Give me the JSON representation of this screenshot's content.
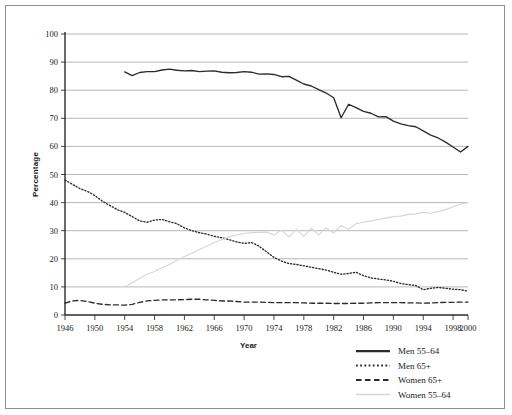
{
  "chart_data": {
    "type": "line",
    "title": "",
    "xlabel": "Year",
    "ylabel": "Percentage",
    "xlim": [
      1946,
      2000
    ],
    "ylim": [
      0,
      100
    ],
    "ytick_step": 10,
    "grid": "horizontal",
    "legend_position": "bottom-right",
    "yticks": [
      "0",
      "10",
      "20",
      "30",
      "40",
      "50",
      "60",
      "70",
      "80",
      "90",
      "100"
    ],
    "xticks": [
      "1946",
      "1950",
      "1954",
      "1958",
      "1962",
      "1966",
      "1970",
      "1974",
      "1978",
      "1982",
      "1986",
      "1990",
      "1994",
      "1998",
      "2000"
    ],
    "series": [
      {
        "name": "Men 55–64",
        "style": "solid",
        "color": "#2b2b2b",
        "x": [
          1954,
          1955,
          1956,
          1957,
          1958,
          1959,
          1960,
          1961,
          1962,
          1963,
          1964,
          1965,
          1966,
          1967,
          1968,
          1969,
          1970,
          1971,
          1972,
          1973,
          1974,
          1975,
          1976,
          1977,
          1978,
          1979,
          1980,
          1981,
          1982,
          1983,
          1984,
          1985,
          1986,
          1987,
          1988,
          1989,
          1990,
          1991,
          1992,
          1993,
          1994,
          1995,
          1996,
          1997,
          1998,
          1999,
          2000
        ],
        "values": [
          86.5,
          85.2,
          86.3,
          86.6,
          86.6,
          87.2,
          87.5,
          87.1,
          86.9,
          87.0,
          86.6,
          86.8,
          86.9,
          86.4,
          86.2,
          86.3,
          86.6,
          86.4,
          85.7,
          85.8,
          85.6,
          84.8,
          84.9,
          83.6,
          82.2,
          81.5,
          80.2,
          79.0,
          77.3,
          70.2,
          75.0,
          73.8,
          72.5,
          71.8,
          70.5,
          70.6,
          69.0,
          68.0,
          67.4,
          67.0,
          65.5,
          64.0,
          63.0,
          61.5,
          59.8,
          58.0,
          60.0
        ]
      },
      {
        "name": "Men 65+",
        "style": "dotted",
        "color": "#2b2b2b",
        "x": [
          1946,
          1947,
          1948,
          1949,
          1950,
          1951,
          1952,
          1953,
          1954,
          1955,
          1956,
          1957,
          1958,
          1959,
          1960,
          1961,
          1962,
          1963,
          1964,
          1965,
          1966,
          1967,
          1968,
          1969,
          1970,
          1971,
          1972,
          1973,
          1974,
          1975,
          1976,
          1977,
          1978,
          1979,
          1980,
          1981,
          1982,
          1983,
          1984,
          1985,
          1986,
          1987,
          1988,
          1989,
          1990,
          1991,
          1992,
          1993,
          1994,
          1995,
          1996,
          1997,
          1998,
          1999,
          2000
        ],
        "values": [
          48.0,
          46.5,
          45.0,
          44.0,
          42.5,
          40.5,
          39.0,
          37.5,
          36.5,
          35.0,
          33.5,
          33.0,
          33.8,
          34.0,
          33.2,
          32.5,
          31.0,
          30.0,
          29.3,
          28.8,
          28.0,
          27.5,
          26.8,
          26.0,
          25.5,
          25.8,
          24.5,
          22.5,
          20.5,
          19.2,
          18.3,
          18.0,
          17.5,
          17.0,
          16.5,
          16.0,
          15.2,
          14.5,
          14.8,
          15.2,
          14.0,
          13.2,
          12.8,
          12.5,
          12.0,
          11.2,
          10.8,
          10.5,
          9.0,
          9.5,
          9.8,
          9.5,
          9.2,
          9.0,
          8.5
        ]
      },
      {
        "name": "Women 65+",
        "style": "dashed",
        "color": "#2b2b2b",
        "x": [
          1946,
          1947,
          1948,
          1949,
          1950,
          1951,
          1952,
          1953,
          1954,
          1955,
          1956,
          1957,
          1958,
          1959,
          1960,
          1961,
          1962,
          1963,
          1964,
          1965,
          1966,
          1967,
          1968,
          1969,
          1970,
          1971,
          1972,
          1973,
          1974,
          1975,
          1976,
          1977,
          1978,
          1979,
          1980,
          1981,
          1982,
          1983,
          1984,
          1985,
          1986,
          1987,
          1988,
          1989,
          1990,
          1991,
          1992,
          1993,
          1994,
          1995,
          1996,
          1997,
          1998,
          1999,
          2000
        ],
        "values": [
          4.2,
          5.0,
          5.2,
          4.8,
          4.2,
          3.8,
          3.6,
          3.6,
          3.5,
          3.8,
          4.5,
          5.0,
          5.2,
          5.4,
          5.4,
          5.4,
          5.5,
          5.6,
          5.6,
          5.4,
          5.2,
          5.0,
          5.0,
          4.8,
          4.6,
          4.6,
          4.6,
          4.5,
          4.4,
          4.4,
          4.4,
          4.4,
          4.3,
          4.2,
          4.2,
          4.2,
          4.1,
          4.1,
          4.1,
          4.2,
          4.2,
          4.3,
          4.4,
          4.4,
          4.4,
          4.4,
          4.3,
          4.3,
          4.2,
          4.3,
          4.4,
          4.5,
          4.5,
          4.6,
          4.6
        ]
      },
      {
        "name": "Women 55–64",
        "style": "solid-light",
        "color": "#d6d6d6",
        "x": [
          1954,
          1955,
          1956,
          1957,
          1958,
          1959,
          1960,
          1961,
          1962,
          1963,
          1964,
          1965,
          1966,
          1967,
          1968,
          1969,
          1970,
          1971,
          1972,
          1973,
          1974,
          1975,
          1976,
          1977,
          1978,
          1979,
          1980,
          1981,
          1982,
          1983,
          1984,
          1985,
          1986,
          1987,
          1988,
          1989,
          1990,
          1991,
          1992,
          1993,
          1994,
          1995,
          1996,
          1997,
          1998,
          1999,
          2000
        ],
        "values": [
          10.0,
          11.5,
          13.0,
          14.5,
          15.5,
          16.8,
          18.0,
          19.5,
          20.8,
          22.0,
          23.3,
          24.5,
          25.8,
          26.8,
          27.8,
          28.5,
          29.0,
          29.3,
          29.4,
          29.5,
          28.5,
          30.2,
          27.8,
          30.5,
          28.0,
          30.8,
          28.5,
          31.0,
          29.2,
          31.8,
          30.5,
          32.5,
          33.0,
          33.5,
          34.0,
          34.5,
          35.0,
          35.2,
          35.8,
          36.0,
          36.5,
          36.2,
          36.8,
          37.5,
          38.5,
          39.5,
          40.0
        ]
      }
    ]
  },
  "legend": {
    "items": [
      {
        "label": "Men 55–64",
        "style": "solid"
      },
      {
        "label": "Men 65+",
        "style": "dotted"
      },
      {
        "label": "Women 65+",
        "style": "dashed"
      },
      {
        "label": "Women 55–64",
        "style": "solid-light"
      }
    ]
  },
  "axes": {
    "y_title": "Percentage",
    "x_title": "Year"
  }
}
